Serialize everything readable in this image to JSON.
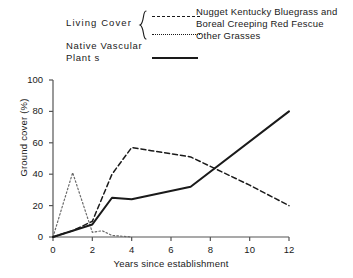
{
  "legend": {
    "group_label": "Living  Cover",
    "native_label": "Native  Vascular Plant s",
    "brace_glyph": "{",
    "entries": [
      {
        "style": "dashed",
        "label": "Nugget Kentucky Bluegrass and Boreal Creeping Red Fescue"
      },
      {
        "style": "dotted",
        "label": "Other Grasses"
      },
      {
        "style": "solid",
        "label": "Native  Vascular Plant s"
      }
    ]
  },
  "chart_data": {
    "type": "line",
    "title": "",
    "xlabel": "Years since establishment",
    "ylabel": "Ground cover (%)",
    "xlim": [
      0,
      12
    ],
    "ylim": [
      0,
      100
    ],
    "xticks": [
      0,
      2,
      4,
      6,
      8,
      10,
      12
    ],
    "yticks": [
      0,
      20,
      40,
      60,
      80,
      100
    ],
    "xtick_labels": [
      "0",
      "2",
      "4",
      "6",
      "8",
      "10",
      "12"
    ],
    "ytick_labels": [
      "0",
      "20",
      "40",
      "60",
      "80",
      "100"
    ],
    "grid": false,
    "legend_position": "above-plot",
    "series": [
      {
        "name": "Nugget Kentucky Bluegrass and Boreal Creeping Red Fescue",
        "style": "dashed",
        "color": "#1a1a1a",
        "x": [
          0,
          1,
          2,
          3,
          4,
          5,
          6,
          7,
          8,
          10,
          12
        ],
        "values": [
          0,
          4,
          10,
          40,
          57,
          55,
          53,
          51,
          45,
          33,
          20
        ]
      },
      {
        "name": "Other Grasses",
        "style": "dotted",
        "color": "#6b6b6b",
        "x": [
          0,
          1,
          2,
          2.5,
          3,
          4
        ],
        "values": [
          0,
          41,
          3,
          4,
          1,
          0
        ]
      },
      {
        "name": "Native Vascular Plants",
        "style": "solid",
        "color": "#1a1a1a",
        "x": [
          0,
          1,
          2,
          3,
          4,
          7,
          12
        ],
        "values": [
          0,
          4,
          8,
          25,
          24,
          32,
          80
        ]
      }
    ]
  }
}
